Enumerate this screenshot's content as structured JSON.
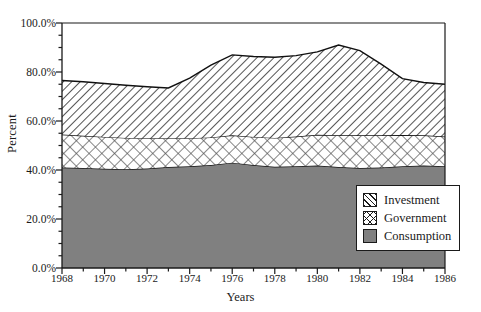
{
  "chart_data": {
    "type": "area",
    "stacked": true,
    "title": "",
    "xlabel": "Years",
    "ylabel": "Percent",
    "xlim": [
      1968,
      1986
    ],
    "ylim": [
      0,
      100
    ],
    "ytick_labels": [
      "0.0%",
      "20.0%",
      "40.0%",
      "60.0%",
      "80.0%",
      "100.0%"
    ],
    "ytick_values": [
      0,
      20,
      40,
      60,
      80,
      100
    ],
    "y_minor_step": 5,
    "xtick_labels": [
      "1968",
      "1970",
      "1972",
      "1974",
      "1976",
      "1978",
      "1980",
      "1982",
      "1984",
      "1986"
    ],
    "xtick_values": [
      1968,
      1970,
      1972,
      1974,
      1976,
      1978,
      1980,
      1982,
      1984,
      1986
    ],
    "grid": false,
    "legend_position": "lower-right",
    "x": [
      1968,
      1969,
      1970,
      1971,
      1972,
      1973,
      1974,
      1975,
      1976,
      1977,
      1978,
      1979,
      1980,
      1981,
      1982,
      1983,
      1984,
      1985,
      1986
    ],
    "series": [
      {
        "name": "Consumption",
        "fill": "solid-gray",
        "color": "#808080",
        "values": [
          41.0,
          40.8,
          40.5,
          40.3,
          40.6,
          41.2,
          41.5,
          42.0,
          43.0,
          42.0,
          41.3,
          41.5,
          41.8,
          41.2,
          40.8,
          41.0,
          41.5,
          41.8,
          41.5
        ]
      },
      {
        "name": "Government",
        "fill": "cross-hatch",
        "color": "#ffffff",
        "values": [
          13.5,
          13.2,
          13.0,
          12.8,
          12.4,
          11.8,
          11.5,
          11.3,
          11.2,
          11.5,
          11.8,
          12.2,
          12.6,
          13.0,
          13.4,
          13.2,
          12.8,
          12.4,
          12.2
        ]
      },
      {
        "name": "Investment",
        "fill": "diagonal-hatch",
        "color": "#ffffff",
        "values": [
          22.0,
          22.0,
          21.8,
          21.5,
          21.0,
          20.5,
          24.5,
          29.5,
          32.8,
          32.8,
          32.9,
          33.0,
          33.8,
          36.8,
          34.5,
          29.0,
          23.0,
          21.5,
          21.3
        ]
      }
    ],
    "cumulative_totals": [
      76.5,
      76.0,
      75.3,
      74.6,
      74.0,
      73.5,
      77.5,
      82.8,
      87.0,
      86.3,
      86.0,
      86.7,
      88.2,
      91.0,
      88.7,
      83.2,
      77.3,
      75.7,
      75.0
    ]
  },
  "legend": {
    "items": [
      {
        "label": "Investment"
      },
      {
        "label": "Government"
      },
      {
        "label": "Consumption"
      }
    ]
  }
}
